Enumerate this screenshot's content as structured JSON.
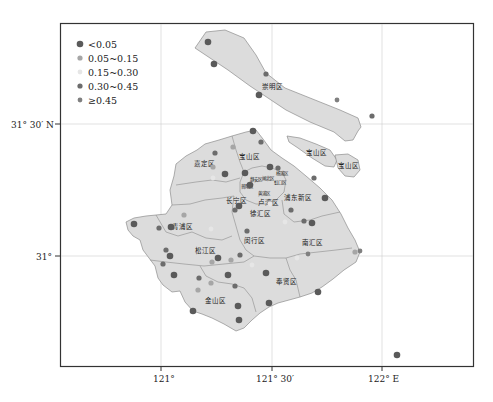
{
  "map": {
    "colors": {
      "land": "#dcdcdc",
      "boundary": "#8c8c8c",
      "frame": "#333333",
      "grid": "#c8c8c8"
    },
    "legend": {
      "items": [
        {
          "label": "<0.05",
          "color": "#5a5a5a",
          "radius": 3.3
        },
        {
          "label": "0.05~0.15",
          "color": "#a6a6a6",
          "radius": 2.6
        },
        {
          "label": "0.15~0.30",
          "color": "#e6e6e6",
          "radius": 2.4
        },
        {
          "label": "0.30~0.45",
          "color": "#6c6c6c",
          "radius": 2.6
        },
        {
          "label": "≥0.45",
          "color": "#808080",
          "radius": 2.4
        }
      ]
    },
    "axes": {
      "x_ticks": [
        {
          "label": "121°",
          "x": 161
        },
        {
          "label": "121° 30′",
          "x": 272
        },
        {
          "label": "122° E",
          "x": 382
        }
      ],
      "y_ticks": [
        {
          "label": "31° 30′ N",
          "y": 124
        },
        {
          "label": "31°",
          "y": 256
        }
      ]
    },
    "districts": [
      {
        "name": "崇明区",
        "x": 270,
        "y": 86
      },
      {
        "name": "宝山区",
        "x": 249,
        "y": 157
      },
      {
        "name": "宝山区",
        "x": 309,
        "y": 152
      },
      {
        "name": "宝山区",
        "x": 347,
        "y": 166
      },
      {
        "name": "嘉定区",
        "x": 206,
        "y": 163
      },
      {
        "name": "浦东新区",
        "x": 299,
        "y": 197
      },
      {
        "name": "长宁区",
        "x": 236,
        "y": 201
      },
      {
        "name": "卢湾区",
        "x": 265,
        "y": 203
      },
      {
        "name": "徐汇区",
        "x": 259,
        "y": 213
      },
      {
        "name": "青浦区",
        "x": 184,
        "y": 226
      },
      {
        "name": "闵行区",
        "x": 266,
        "y": 240
      },
      {
        "name": "南汇区",
        "x": 320,
        "y": 243
      },
      {
        "name": "松江区",
        "x": 207,
        "y": 251
      },
      {
        "name": "奉贤区",
        "x": 287,
        "y": 282
      },
      {
        "name": "金山区",
        "x": 215,
        "y": 301
      }
    ],
    "urban_labels": [
      {
        "name": "静安区",
        "x": 256,
        "y": 180
      },
      {
        "name": "闸北区",
        "x": 265,
        "y": 180
      },
      {
        "name": "虹口区",
        "x": 277,
        "y": 181
      },
      {
        "name": "普陀区",
        "x": 246,
        "y": 186
      },
      {
        "name": "黄浦区",
        "x": 267,
        "y": 193
      },
      {
        "name": "杨浦区",
        "x": 280,
        "y": 174
      }
    ],
    "points": [
      {
        "x": 208,
        "y": 42,
        "class": 0
      },
      {
        "x": 214,
        "y": 64,
        "class": 0
      },
      {
        "x": 266,
        "y": 74,
        "class": 3
      },
      {
        "x": 259,
        "y": 95,
        "class": 0
      },
      {
        "x": 337,
        "y": 100,
        "class": 4
      },
      {
        "x": 372,
        "y": 116,
        "class": 3
      },
      {
        "x": 253,
        "y": 131,
        "class": 0
      },
      {
        "x": 261,
        "y": 142,
        "class": 3
      },
      {
        "x": 215,
        "y": 153,
        "class": 3
      },
      {
        "x": 233,
        "y": 147,
        "class": 1
      },
      {
        "x": 213,
        "y": 167,
        "class": 1
      },
      {
        "x": 225,
        "y": 174,
        "class": 0
      },
      {
        "x": 213,
        "y": 178,
        "class": 2
      },
      {
        "x": 245,
        "y": 173,
        "class": 0
      },
      {
        "x": 270,
        "y": 167,
        "class": 0
      },
      {
        "x": 278,
        "y": 168,
        "class": 3
      },
      {
        "x": 250,
        "y": 185,
        "class": 0
      },
      {
        "x": 239,
        "y": 206,
        "class": 0
      },
      {
        "x": 235,
        "y": 210,
        "class": 3
      },
      {
        "x": 270,
        "y": 203,
        "class": 1
      },
      {
        "x": 291,
        "y": 210,
        "class": 3
      },
      {
        "x": 314,
        "y": 178,
        "class": 3
      },
      {
        "x": 325,
        "y": 198,
        "class": 0
      },
      {
        "x": 312,
        "y": 223,
        "class": 0
      },
      {
        "x": 304,
        "y": 221,
        "class": 3
      },
      {
        "x": 270,
        "y": 204,
        "class": 2
      },
      {
        "x": 134,
        "y": 224,
        "class": 0
      },
      {
        "x": 159,
        "y": 228,
        "class": 3
      },
      {
        "x": 171,
        "y": 227,
        "class": 0
      },
      {
        "x": 184,
        "y": 215,
        "class": 1
      },
      {
        "x": 211,
        "y": 229,
        "class": 2
      },
      {
        "x": 247,
        "y": 231,
        "class": 3
      },
      {
        "x": 285,
        "y": 222,
        "class": 2
      },
      {
        "x": 166,
        "y": 250,
        "class": 3
      },
      {
        "x": 170,
        "y": 256,
        "class": 0
      },
      {
        "x": 163,
        "y": 264,
        "class": 3
      },
      {
        "x": 218,
        "y": 258,
        "class": 0
      },
      {
        "x": 212,
        "y": 262,
        "class": 1
      },
      {
        "x": 231,
        "y": 260,
        "class": 1
      },
      {
        "x": 228,
        "y": 275,
        "class": 0
      },
      {
        "x": 240,
        "y": 255,
        "class": 3
      },
      {
        "x": 174,
        "y": 275,
        "class": 0
      },
      {
        "x": 199,
        "y": 278,
        "class": 3
      },
      {
        "x": 211,
        "y": 283,
        "class": 1
      },
      {
        "x": 235,
        "y": 286,
        "class": 3
      },
      {
        "x": 266,
        "y": 273,
        "class": 0
      },
      {
        "x": 252,
        "y": 265,
        "class": 2
      },
      {
        "x": 198,
        "y": 290,
        "class": 1
      },
      {
        "x": 238,
        "y": 306,
        "class": 0
      },
      {
        "x": 269,
        "y": 303,
        "class": 0
      },
      {
        "x": 193,
        "y": 311,
        "class": 0
      },
      {
        "x": 239,
        "y": 320,
        "class": 0
      },
      {
        "x": 318,
        "y": 292,
        "class": 0
      },
      {
        "x": 308,
        "y": 254,
        "class": 4
      },
      {
        "x": 360,
        "y": 251,
        "class": 4
      },
      {
        "x": 355,
        "y": 252,
        "class": 1
      },
      {
        "x": 297,
        "y": 258,
        "class": 2
      },
      {
        "x": 397,
        "y": 355,
        "class": 0
      }
    ]
  }
}
